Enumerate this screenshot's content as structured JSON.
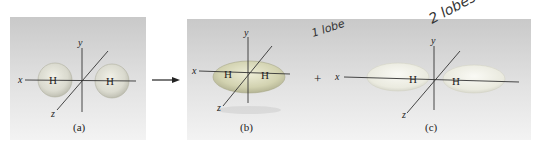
{
  "figure": {
    "panels": [
      {
        "id": "a",
        "caption": "(a)",
        "atoms": [
          "H",
          "H"
        ],
        "orbital": "two separate spherical 1s orbitals"
      },
      {
        "id": "b",
        "caption": "(b)",
        "atoms": [
          "H",
          "H"
        ],
        "orbital": "bonding sigma orbital (1 lobe)"
      },
      {
        "id": "c",
        "caption": "(c)",
        "atoms": [
          "H",
          "H"
        ],
        "orbital": "antibonding sigma* orbital (2 lobes)"
      }
    ],
    "axes": {
      "x": "x",
      "y": "y",
      "z": "z"
    },
    "operator_arrow": "→",
    "operator_plus": "+",
    "annotations": {
      "b": "1 lobe",
      "c": "2 lobes"
    }
  }
}
